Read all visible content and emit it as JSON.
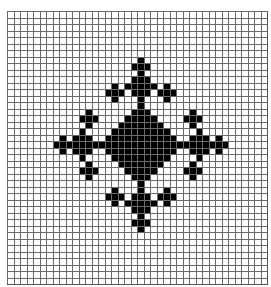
{
  "figure": {
    "grid": {
      "cols": 40,
      "rows": 42,
      "line_color": "#6a6a6a",
      "fill_color": "#000000",
      "empty_color": "#ffffff"
    },
    "center": {
      "row": 20,
      "col": 20
    },
    "shapes": [
      {
        "type": "diamond",
        "row": 20,
        "col": 20,
        "radius": 6
      },
      {
        "type": "diamond",
        "row": 11,
        "col": 20,
        "radius": 2
      },
      {
        "type": "diamond",
        "row": 29,
        "col": 20,
        "radius": 2
      },
      {
        "type": "diamond",
        "row": 20,
        "col": 11,
        "radius": 2
      },
      {
        "type": "diamond",
        "row": 20,
        "col": 29,
        "radius": 2
      },
      {
        "type": "cross",
        "row": 8,
        "col": 20
      },
      {
        "type": "cross",
        "row": 32,
        "col": 20
      },
      {
        "type": "cross",
        "row": 20,
        "col": 8
      },
      {
        "type": "cross",
        "row": 20,
        "col": 32
      },
      {
        "type": "cross",
        "row": 12,
        "col": 16
      },
      {
        "type": "cross",
        "row": 12,
        "col": 24
      },
      {
        "type": "cross",
        "row": 28,
        "col": 16
      },
      {
        "type": "cross",
        "row": 28,
        "col": 24
      },
      {
        "type": "cross",
        "row": 16,
        "col": 12
      },
      {
        "type": "cross",
        "row": 24,
        "col": 12
      },
      {
        "type": "cross",
        "row": 16,
        "col": 28
      },
      {
        "type": "cross",
        "row": 24,
        "col": 28
      }
    ]
  }
}
